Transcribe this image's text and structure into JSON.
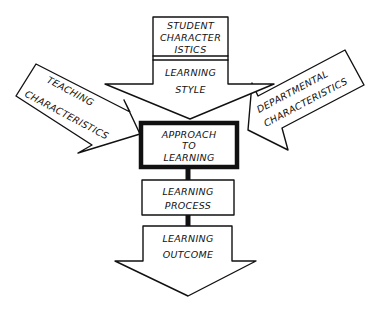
{
  "diagram": {
    "type": "flow",
    "style": "hand-drawn sketch, black ink on white",
    "nodes": {
      "student_characteristics": {
        "line1": "STUDENT",
        "line2": "CHARACTER",
        "line3": "ISTICS"
      },
      "learning_style": {
        "line1": "LEARNING",
        "line2": "STYLE"
      },
      "teaching_characteristics": {
        "line1": "TEACHING",
        "line2": "CHARACTERISTICS"
      },
      "departmental_characteristics": {
        "line1": "DEPARTMENTAL",
        "line2": "CHARACTERISTICS"
      },
      "approach_to_learning": {
        "line1": "APPROACH",
        "line2": "TO",
        "line3": "LEARNING"
      },
      "learning_process": {
        "line1": "LEARNING",
        "line2": "PROCESS"
      },
      "learning_outcome": {
        "line1": "LEARNING",
        "line2": "OUTCOME"
      }
    },
    "edges": [
      {
        "from": "STUDENT CHARACTERISTICS",
        "to": "LEARNING STYLE"
      },
      {
        "from": "LEARNING STYLE",
        "to": "APPROACH TO LEARNING"
      },
      {
        "from": "TEACHING CHARACTERISTICS",
        "to": "APPROACH TO LEARNING"
      },
      {
        "from": "DEPARTMENTAL CHARACTERISTICS",
        "to": "APPROACH TO LEARNING"
      },
      {
        "from": "APPROACH TO LEARNING",
        "to": "LEARNING PROCESS"
      },
      {
        "from": "LEARNING PROCESS",
        "to": "LEARNING OUTCOME"
      }
    ]
  }
}
